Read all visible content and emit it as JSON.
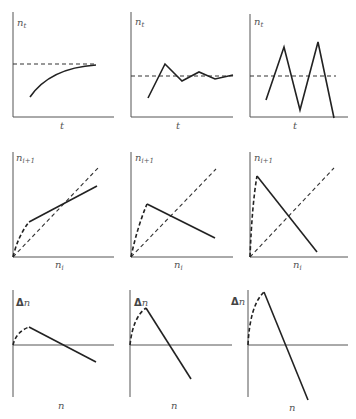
{
  "figure": {
    "rows": [
      {
        "name": "time-series",
        "y_label": "n",
        "y_label_sub": "t",
        "x_label": "t",
        "panels": [
          {
            "behavior": "monotonic damped approach to equilibrium"
          },
          {
            "behavior": "damped oscillations"
          },
          {
            "behavior": "diverging oscillations"
          }
        ]
      },
      {
        "name": "recruitment-curves",
        "y_label": "n",
        "y_label_sub": "i+1",
        "x_label": "n",
        "x_label_sub": "i",
        "panels": [
          {
            "behavior": "shallow negative slope beyond peak"
          },
          {
            "behavior": "moderate negative slope"
          },
          {
            "behavior": "steep negative slope"
          }
        ]
      },
      {
        "name": "change-curves",
        "y_label_delta": "Δ",
        "y_label": "n",
        "x_label": "n",
        "panels": [
          {
            "behavior": "small slope"
          },
          {
            "behavior": "medium slope"
          },
          {
            "behavior": "large slope"
          }
        ]
      }
    ],
    "colors": {
      "axis": "#555555",
      "line": "#222222",
      "label": "#555555"
    }
  }
}
